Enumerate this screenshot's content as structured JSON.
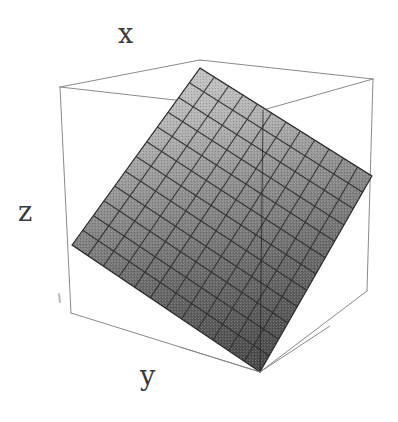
{
  "figure": {
    "background_color": "#ffffff",
    "width": 398,
    "height": 422
  },
  "axes": {
    "x_label": "x",
    "z_label": "z",
    "y_label": "y",
    "label_color": "#3a3a3a",
    "box_line_color": "#8a8a8a",
    "box_line_width": 1
  },
  "surface": {
    "mesh_line_color": "#2b2b2b",
    "fill_light": "#bdbdbd",
    "fill_dark": "#4a4a4a",
    "grid_rows": 12,
    "grid_cols": 12
  },
  "chart_data": {
    "type": "surface",
    "title": "",
    "xlabel": "x",
    "ylabel": "y",
    "zlabel": "z",
    "grid": true,
    "legend": false,
    "projection": "3d-box-wireframe",
    "mesh": {
      "nx": 12,
      "ny": 12,
      "x_range": [
        0,
        1
      ],
      "y_range": [
        0,
        1
      ],
      "z_range": [
        0,
        1
      ],
      "z_function": "z = 0.5*x + 0.5*y"
    },
    "shading": {
      "scheme": "grayscale",
      "lightest_corner": "top",
      "darkest_corner": "bottom",
      "light_value": "#c4c4c4",
      "dark_value": "#454545"
    },
    "box_corners_px": {
      "top_apex": [
        200,
        60
      ],
      "top_left_back": [
        60,
        87
      ],
      "top_right_back": [
        373,
        79
      ],
      "bottom_front": [
        260,
        372
      ],
      "bottom_left": [
        71,
        313
      ],
      "bottom_right": [
        367,
        291
      ]
    },
    "surface_corners_px": {
      "apex": [
        200,
        68
      ],
      "left": [
        72,
        245
      ],
      "right": [
        372,
        176
      ],
      "front_bottom": [
        260,
        372
      ]
    },
    "tick_marks": [
      {
        "name": "z-axis-tick",
        "x": 59,
        "y": 298
      }
    ]
  }
}
